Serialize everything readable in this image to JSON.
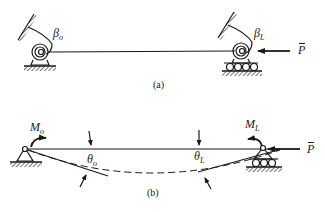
{
  "figure": {
    "panel_a": {
      "caption": "(a)",
      "labels": {
        "beta_o": {
          "symbol": "β",
          "sub": "o"
        },
        "beta_L": {
          "symbol": "β",
          "sub": "L"
        },
        "load": {
          "symbol": "P"
        }
      },
      "elements": [
        "rotational-spring-left",
        "pin-support-left",
        "beam",
        "rotational-spring-right",
        "roller-support-right",
        "axial-load-arrow"
      ]
    },
    "panel_b": {
      "caption": "(b)",
      "labels": {
        "moment_o": {
          "symbol": "M",
          "sub": "o"
        },
        "moment_L": {
          "symbol": "M",
          "sub": "L"
        },
        "theta_o": {
          "symbol": "θ",
          "sub": "o"
        },
        "theta_L": {
          "symbol": "θ",
          "sub": "L"
        },
        "load": {
          "symbol": "P"
        }
      },
      "elements": [
        "pin-support-left",
        "moment-arrow-left",
        "beam",
        "deflected-shape-dashed",
        "moment-arrow-right",
        "roller-support-right",
        "axial-load-arrow"
      ]
    },
    "colors": {
      "ink": "#1a1a1a",
      "background": "#ffffff"
    }
  }
}
